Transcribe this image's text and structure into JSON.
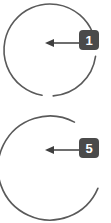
{
  "diagram": {
    "canvas": {
      "width": 111,
      "height": 223,
      "background_color": "#ffffff"
    },
    "style": {
      "ring_stroke_color": "#5a5a5a",
      "ring_stroke_width": 1.6,
      "badge_fill_color": "#4a4a4a",
      "badge_text_color": "#ffffff",
      "leader_line_color": "#4a4a4a",
      "leader_line_width": 1.6,
      "arrowhead_color": "#3f3f3f"
    },
    "parts": [
      {
        "id": "part-1",
        "label": "1",
        "shape": "split-ring-arc",
        "center_x": 50,
        "center_y": 50,
        "radius": 46,
        "arcs": [
          {
            "start_deg": 8,
            "end_deg": 86
          },
          {
            "start_deg": 100,
            "end_deg": 338
          }
        ],
        "badge": {
          "x": 79,
          "y": 30,
          "width": 20,
          "height": 20,
          "corner_radius": 4
        },
        "leader": {
          "from_x": 79,
          "to_x": 45,
          "y": 43,
          "arrow_direction": "left",
          "arrowhead_length": 9,
          "arrowhead_width": 8
        }
      },
      {
        "id": "part-5",
        "label": "5",
        "shape": "split-ring-arc",
        "center_x": 50,
        "center_y": 168,
        "radius": 52,
        "arcs": [
          {
            "start_deg": 23,
            "end_deg": 298
          }
        ],
        "badge": {
          "x": 79,
          "y": 138,
          "width": 20,
          "height": 20,
          "corner_radius": 4
        },
        "leader": {
          "from_x": 79,
          "to_x": 45,
          "y": 150,
          "arrow_direction": "left",
          "arrowhead_length": 9,
          "arrowhead_width": 8
        }
      }
    ]
  }
}
